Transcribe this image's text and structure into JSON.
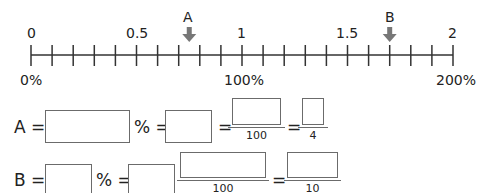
{
  "number_line": {
    "min": 0,
    "max": 2,
    "tick_step": 0.1,
    "top_labels": [
      {
        "text": "0",
        "value": 0
      },
      {
        "text": "0.5",
        "value": 0.5
      },
      {
        "text": "1",
        "value": 1
      },
      {
        "text": "1.5",
        "value": 1.5
      },
      {
        "text": "2",
        "value": 2
      }
    ],
    "bottom_labels": [
      {
        "text": "0%",
        "value": 0
      },
      {
        "text": "100%",
        "value": 1
      },
      {
        "text": "200%",
        "value": 2
      }
    ],
    "markers": [
      {
        "label": "A",
        "value": 0.75
      },
      {
        "label": "B",
        "value": 1.7
      }
    ],
    "line_color": "#333333",
    "arrow_color": "#777777"
  },
  "equations": {
    "row_a": {
      "var": "A",
      "equals": "=",
      "percent_sign": "%",
      "equals2": "=",
      "equals3": "=",
      "fraction1_denominator": "100",
      "equals4": "=",
      "fraction2_denominator": "4"
    },
    "row_b": {
      "var": "B",
      "equals": "=",
      "percent_sign": "%",
      "equals2": "=",
      "fraction1_denominator": "100",
      "equals3": "=",
      "fraction2_denominator": "10"
    }
  }
}
